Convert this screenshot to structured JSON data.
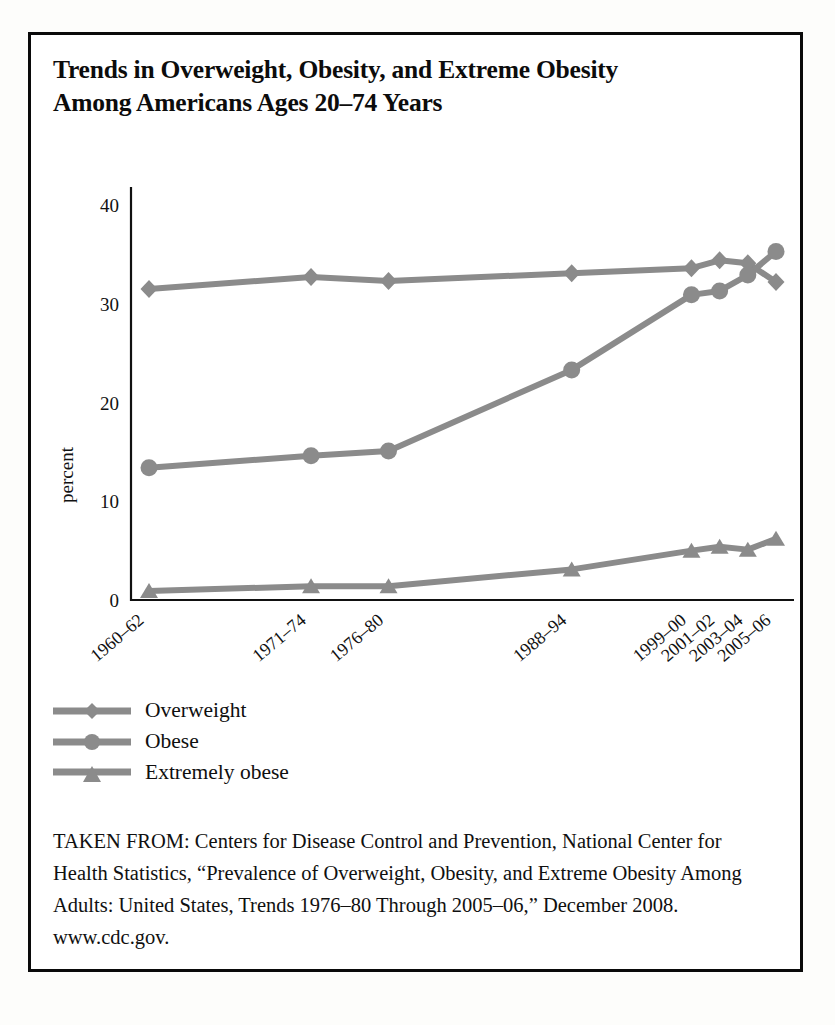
{
  "figure": {
    "title": "Trends in Overweight, Obesity, and Extreme Obesity Among Americans Ages 20–74 Years",
    "title_line1": "Trends in Overweight, Obesity, and Extreme Obesity",
    "title_line2": "Among Americans Ages 20–74 Years",
    "source_note": "TAKEN FROM: Centers for Disease Control and Prevention, National Center for Health Statistics, “Prevalence of Overweight, Obesity, and Extreme Obesity Among Adults: United States, Trends 1976–80 Through 2005–06,” December 2008. www.cdc.gov.",
    "border_color": "#0a0a0a",
    "background_color": "#ffffff"
  },
  "legend": {
    "position": "below-plot",
    "items": [
      {
        "label": "Overweight",
        "marker": "diamond",
        "color": "#8b8b8b"
      },
      {
        "label": "Obese",
        "marker": "circle",
        "color": "#8b8b8b"
      },
      {
        "label": "Extremely obese",
        "marker": "triangle",
        "color": "#8b8b8b"
      }
    ]
  },
  "chart_data": {
    "type": "line",
    "title": "Trends in Overweight, Obesity, and Extreme Obesity Among Americans Ages 20–74 Years",
    "xlabel": "",
    "ylabel": "percent",
    "ylim": [
      0,
      40
    ],
    "yticks": [
      0,
      10,
      20,
      30,
      40
    ],
    "ytick_labels": [
      "0",
      "10",
      "20",
      "30",
      "40"
    ],
    "grid": false,
    "legend_position": "below",
    "categories": [
      "1960–62",
      "1971–74",
      "1976–80",
      "1988–94",
      "1999–00",
      "2001–02",
      "2003–04",
      "2005–06"
    ],
    "series": [
      {
        "name": "Overweight",
        "marker": "diamond",
        "color": "#8b8b8b",
        "values": [
          31.5,
          32.7,
          32.3,
          33.1,
          33.6,
          34.4,
          34.1,
          32.2
        ]
      },
      {
        "name": "Obese",
        "marker": "circle",
        "color": "#8b8b8b",
        "values": [
          13.4,
          14.6,
          15.1,
          23.3,
          30.9,
          31.3,
          32.9,
          35.3
        ]
      },
      {
        "name": "Extremely obese",
        "marker": "triangle",
        "color": "#8b8b8b",
        "values": [
          0.9,
          1.4,
          1.4,
          3.1,
          5.0,
          5.4,
          5.1,
          6.2
        ]
      }
    ]
  }
}
